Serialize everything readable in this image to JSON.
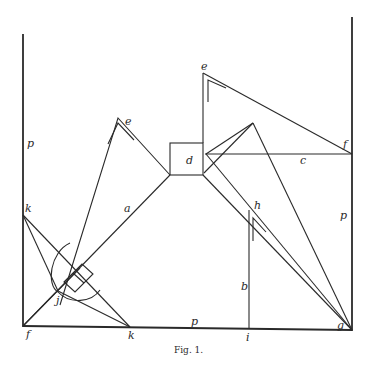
{
  "figure": {
    "caption": "Fig. 1.",
    "labels": {
      "p_left": "p",
      "p_right": "p",
      "p_bottom": "p",
      "e_left": "e",
      "e_top": "e",
      "d": "d",
      "c": "c",
      "f_top": "f",
      "f_bottom": "f",
      "a": "a",
      "b": "b",
      "h": "h",
      "i": "i",
      "g": "g",
      "k_left": "k",
      "k_bottom": "k",
      "j": "j"
    },
    "colors": {
      "ink": "#2a2a2a",
      "paper": "#ffffff"
    }
  }
}
